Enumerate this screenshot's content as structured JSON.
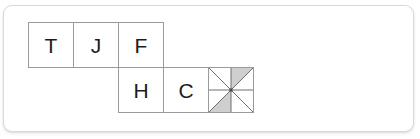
{
  "panel": {
    "background_color": "#ffffff",
    "border_color": "#d9d9d9",
    "corner_radius_px": 9
  },
  "board": {
    "name": "letter-tile-board",
    "cell_size_px": 46,
    "tile_border_color": "#9a9a9a",
    "tile_background_color": "#ffffff",
    "letter_color": "#1c1c1c",
    "origin": {
      "x": 24,
      "y": 16
    },
    "rows": [
      {
        "row_index": 0,
        "tiles": [
          {
            "col": 0,
            "label": "T",
            "type": "letter"
          },
          {
            "col": 1,
            "label": "J",
            "type": "letter"
          },
          {
            "col": 2,
            "label": "F",
            "type": "letter"
          }
        ]
      },
      {
        "row_index": 1,
        "tiles": [
          {
            "col": 2,
            "label": "H",
            "type": "letter"
          },
          {
            "col": 3,
            "label": "C",
            "type": "letter"
          },
          {
            "col": 4,
            "label": "",
            "type": "pinwheel"
          }
        ]
      }
    ],
    "letters_in_reading_order": [
      "T",
      "J",
      "F",
      "H",
      "C"
    ]
  },
  "pinwheel": {
    "name": "pinwheel-wildcard-tile",
    "sector_count": 8,
    "line_color": "#6e6e6e",
    "shaded_sector_color": "#cfcfcf",
    "unshaded_sector_color": "#ffffff",
    "shaded_sectors": [
      1,
      5
    ],
    "description": "eight triangular sectors formed by both diagonals and a center cross; two opposite sectors shaded gray"
  }
}
